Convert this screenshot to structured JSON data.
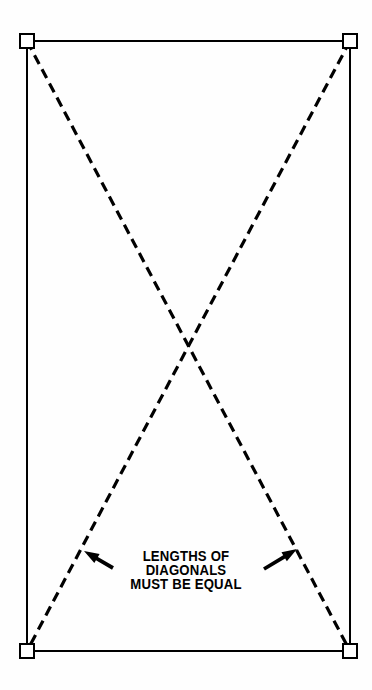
{
  "diagram": {
    "type": "technical-line-diagram",
    "colors": {
      "background": "#fefefe",
      "ink": "#000000"
    },
    "rectangle": {
      "name": "layout-rectangle",
      "left": 27,
      "top": 41,
      "right": 350,
      "bottom": 651,
      "stroke_width": 2,
      "stroke_color": "#000000"
    },
    "corner_markers": {
      "name": "corner-square-marker",
      "size": 14,
      "stroke_width": 2,
      "shape": "hollow-square",
      "points": [
        {
          "label": "top-left",
          "x": 27,
          "y": 41
        },
        {
          "label": "top-right",
          "x": 350,
          "y": 41
        },
        {
          "label": "bottom-left",
          "x": 27,
          "y": 651
        },
        {
          "label": "bottom-right",
          "x": 350,
          "y": 651
        }
      ]
    },
    "diagonals": {
      "name": "diagonal-dashed-line",
      "stroke_width": 3.2,
      "stroke_color": "#000000",
      "dash_length": 10,
      "gap_length": 6,
      "intersection": {
        "x": 188,
        "y": 346
      },
      "lines": [
        {
          "label": "diagonal-top-left-to-bottom-right",
          "x1": 27,
          "y1": 41,
          "x2": 350,
          "y2": 651
        },
        {
          "label": "diagonal-top-right-to-bottom-left",
          "x1": 350,
          "y1": 41,
          "x2": 27,
          "y2": 651
        }
      ]
    },
    "arrows": [
      {
        "label": "left-pointer-arrow",
        "direction": "up-left",
        "tail_x": 113,
        "tail_y": 568,
        "tip_x": 84,
        "tip_y": 551
      },
      {
        "label": "right-pointer-arrow",
        "direction": "up-right",
        "tail_x": 264,
        "tail_y": 569,
        "tip_x": 297,
        "tip_y": 549
      }
    ],
    "caption": {
      "name": "diagram-caption",
      "lines": [
        "LENGTHS OF",
        "DIAGONALS",
        "MUST BE EQUAL"
      ],
      "font_size_px": 14,
      "font_weight": "bold",
      "align": "center",
      "color": "#000000"
    }
  }
}
